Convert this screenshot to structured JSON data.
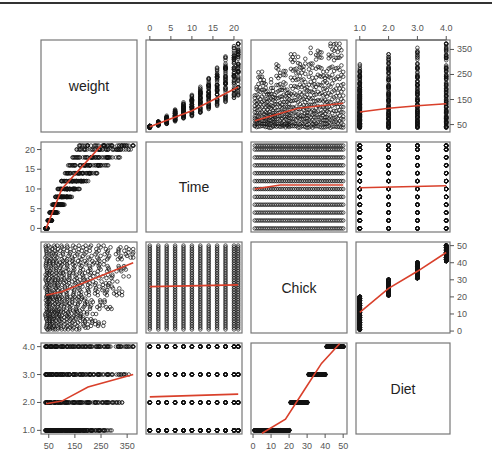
{
  "chart_data": {
    "type": "scatter",
    "kind": "pairs-matrix",
    "variables": [
      "weight",
      "Time",
      "Chick",
      "Diet"
    ],
    "smoother_color": "#d9402b",
    "point_color": "#000000",
    "axes": {
      "weight": {
        "ticks": [
          50,
          150,
          250,
          350
        ],
        "range": [
          35,
          373
        ]
      },
      "Time": {
        "ticks": [
          0,
          5,
          10,
          15,
          20
        ],
        "range": [
          0,
          21
        ]
      },
      "Chick": {
        "ticks": [
          0,
          10,
          20,
          30,
          40,
          50
        ],
        "range": [
          1,
          50
        ]
      },
      "Diet": {
        "ticks": [
          "1.0",
          "2.0",
          "3.0",
          "4.0"
        ],
        "range": [
          1,
          4
        ]
      }
    },
    "axis_placement": {
      "top": [
        {
          "var": "Time",
          "labels": [
            "0",
            "5",
            "10",
            "15",
            "20"
          ]
        },
        {
          "var": "Diet",
          "labels": [
            "1.0",
            "2.0",
            "3.0",
            "4.0"
          ]
        }
      ],
      "right": [
        {
          "var": "weight",
          "labels": [
            "350",
            "250",
            "150",
            "50"
          ]
        },
        {
          "var": "Chick",
          "labels": [
            "50",
            "40",
            "30",
            "20",
            "10",
            "0"
          ]
        }
      ],
      "left": [
        {
          "var": "Time",
          "labels": [
            "20",
            "15",
            "10",
            "5",
            "0"
          ]
        },
        {
          "var": "Diet",
          "labels": [
            "4.0",
            "3.0",
            "2.0",
            "1.0"
          ]
        }
      ],
      "bottom": [
        {
          "var": "weight",
          "labels": [
            "50",
            "150",
            "250",
            "350"
          ]
        },
        {
          "var": "Chick",
          "labels": [
            "0",
            "10",
            "20",
            "30",
            "40",
            "50"
          ]
        }
      ]
    },
    "panels": [
      {
        "row": "weight",
        "col": "Time",
        "trend": "increasing",
        "smoother": [
          [
            0,
            41
          ],
          [
            10,
            105
          ],
          [
            21,
            200
          ]
        ]
      },
      {
        "row": "weight",
        "col": "Chick",
        "trend": "slight increase",
        "smoother": [
          [
            1,
            65
          ],
          [
            25,
            115
          ],
          [
            50,
            135
          ]
        ]
      },
      {
        "row": "weight",
        "col": "Diet",
        "trend": "slight increase",
        "smoother": [
          [
            1,
            100
          ],
          [
            2,
            115
          ],
          [
            3,
            125
          ],
          [
            4,
            133
          ]
        ]
      },
      {
        "row": "Time",
        "col": "weight",
        "trend": "increasing concave",
        "smoother": [
          [
            40,
            0
          ],
          [
            100,
            10
          ],
          [
            250,
            21
          ]
        ]
      },
      {
        "row": "Time",
        "col": "Chick",
        "trend": "flat",
        "smoother": [
          [
            1,
            10
          ],
          [
            15,
            11
          ],
          [
            50,
            11
          ]
        ]
      },
      {
        "row": "Time",
        "col": "Diet",
        "trend": "flat",
        "smoother": [
          [
            1,
            10.3
          ],
          [
            4,
            10.8
          ]
        ]
      },
      {
        "row": "Chick",
        "col": "weight",
        "trend": "increasing",
        "smoother": [
          [
            40,
            21
          ],
          [
            100,
            23
          ],
          [
            373,
            40
          ]
        ]
      },
      {
        "row": "Chick",
        "col": "Time",
        "trend": "flat",
        "smoother": [
          [
            0,
            26
          ],
          [
            21,
            27
          ]
        ]
      },
      {
        "row": "Chick",
        "col": "Diet",
        "trend": "increasing",
        "smoother": [
          [
            1,
            11
          ],
          [
            2,
            25
          ],
          [
            3,
            35
          ],
          [
            4,
            46
          ]
        ]
      },
      {
        "row": "Diet",
        "col": "weight",
        "trend": "increasing",
        "smoother": [
          [
            40,
            1.95
          ],
          [
            100,
            2.05
          ],
          [
            200,
            2.55
          ],
          [
            373,
            3.0
          ]
        ]
      },
      {
        "row": "Diet",
        "col": "Time",
        "trend": "flat",
        "smoother": [
          [
            0,
            2.2
          ],
          [
            21,
            2.3
          ]
        ]
      },
      {
        "row": "Diet",
        "col": "Chick",
        "trend": "step increasing",
        "smoother": [
          [
            5,
            0.9
          ],
          [
            18,
            1.4
          ],
          [
            28,
            2.4
          ],
          [
            38,
            3.4
          ],
          [
            48,
            4.1
          ]
        ]
      }
    ],
    "title": "",
    "xlabel": "",
    "ylabel": "",
    "grid": false,
    "legend": null
  },
  "labels": {
    "weight": "weight",
    "time": "Time",
    "chick": "Chick",
    "diet": "Diet"
  }
}
